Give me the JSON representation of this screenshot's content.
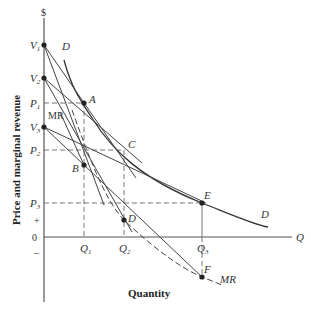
{
  "diagram": {
    "y_axis_label": "Price and marginal revenue",
    "x_axis_label": "Quantity",
    "y_axis_unit": "$",
    "x_axis_symbol": "Q",
    "origin": "0",
    "plus_sign": "+",
    "minus_sign": "–",
    "intercepts": [
      {
        "id": "V1",
        "letter": "V",
        "sub": "1"
      },
      {
        "id": "V2",
        "letter": "V",
        "sub": "2"
      },
      {
        "id": "V3",
        "letter": "V",
        "sub": "3"
      }
    ],
    "prices": [
      {
        "id": "P1",
        "letter": "P",
        "sub": "1"
      },
      {
        "id": "P2",
        "letter": "P",
        "sub": "2"
      },
      {
        "id": "P3",
        "letter": "P",
        "sub": "3"
      }
    ],
    "quantities": [
      {
        "id": "Q1",
        "letter": "Q",
        "sub": "1"
      },
      {
        "id": "Q2",
        "letter": "Q",
        "sub": "2"
      },
      {
        "id": "Q3",
        "letter": "Q",
        "sub": "3"
      }
    ],
    "points": {
      "A": "A",
      "B": "B",
      "C": "C",
      "D": "D",
      "E": "E",
      "F": "F"
    },
    "curve_labels": {
      "demand_top": "D",
      "demand_right": "D",
      "mr_left": "MR",
      "mr_right": "MR"
    }
  }
}
